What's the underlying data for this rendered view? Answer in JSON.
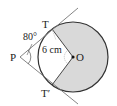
{
  "diagram": {
    "labels": {
      "P": "P",
      "T": "T",
      "T_prime": "T′",
      "O": "O",
      "angle": "80°",
      "radius": "6 cm"
    },
    "colors": {
      "shaded_sector": "#d9d9d9",
      "lines": "#333333",
      "tangent_lines": "#777777"
    }
  }
}
